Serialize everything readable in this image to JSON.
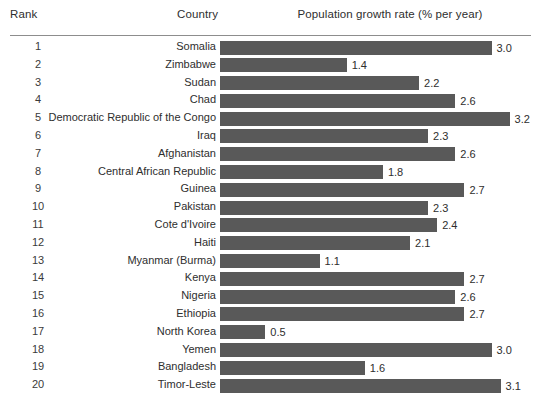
{
  "header": {
    "rank_label": "Rank",
    "country_label": "Country",
    "value_label": "Population growth rate (% per year)"
  },
  "style": {
    "bar_color": "#595959",
    "rule_color": "#8d8d8d",
    "text_color": "#2e2e2e",
    "background": "#ffffff"
  },
  "chart_data": {
    "type": "bar",
    "orientation": "horizontal",
    "title": "Population growth rate (% per year)",
    "xlabel": "Population growth rate (% per year)",
    "ylabel": "Country",
    "xlim": [
      0,
      3.4
    ],
    "grid": false,
    "legend": null,
    "value_labels": true,
    "categories": [
      "Somalia",
      "Zimbabwe",
      "Sudan",
      "Chad",
      "Democratic Republic of the Congo",
      "Iraq",
      "Afghanistan",
      "Central African Republic",
      "Guinea",
      "Pakistan",
      "Cote d'Ivoire",
      "Haiti",
      "Myanmar (Burma)",
      "Kenya",
      "Nigeria",
      "Ethiopia",
      "North Korea",
      "Yemen",
      "Bangladesh",
      "Timor-Leste"
    ],
    "values": [
      3.0,
      1.4,
      2.2,
      2.6,
      3.2,
      2.3,
      2.6,
      1.8,
      2.7,
      2.3,
      2.4,
      2.1,
      1.1,
      2.7,
      2.6,
      2.7,
      0.5,
      3.0,
      1.6,
      3.1
    ],
    "ranks": [
      1,
      2,
      3,
      4,
      5,
      6,
      7,
      8,
      9,
      10,
      11,
      12,
      13,
      14,
      15,
      16,
      17,
      18,
      19,
      20
    ]
  },
  "rows": [
    {
      "rank": "1",
      "country": "Somalia",
      "value": 3.0,
      "value_label": "3.0"
    },
    {
      "rank": "2",
      "country": "Zimbabwe",
      "value": 1.4,
      "value_label": "1.4"
    },
    {
      "rank": "3",
      "country": "Sudan",
      "value": 2.2,
      "value_label": "2.2"
    },
    {
      "rank": "4",
      "country": "Chad",
      "value": 2.6,
      "value_label": "2.6"
    },
    {
      "rank": "5",
      "country": "Democratic Republic of the Congo",
      "value": 3.2,
      "value_label": "3.2"
    },
    {
      "rank": "6",
      "country": "Iraq",
      "value": 2.3,
      "value_label": "2.3"
    },
    {
      "rank": "7",
      "country": "Afghanistan",
      "value": 2.6,
      "value_label": "2.6"
    },
    {
      "rank": "8",
      "country": "Central African Republic",
      "value": 1.8,
      "value_label": "1.8"
    },
    {
      "rank": "9",
      "country": "Guinea",
      "value": 2.7,
      "value_label": "2.7"
    },
    {
      "rank": "10",
      "country": "Pakistan",
      "value": 2.3,
      "value_label": "2.3"
    },
    {
      "rank": "11",
      "country": "Cote d'Ivoire",
      "value": 2.4,
      "value_label": "2.4"
    },
    {
      "rank": "12",
      "country": "Haiti",
      "value": 2.1,
      "value_label": "2.1"
    },
    {
      "rank": "13",
      "country": "Myanmar (Burma)",
      "value": 1.1,
      "value_label": "1.1"
    },
    {
      "rank": "14",
      "country": "Kenya",
      "value": 2.7,
      "value_label": "2.7"
    },
    {
      "rank": "15",
      "country": "Nigeria",
      "value": 2.6,
      "value_label": "2.6"
    },
    {
      "rank": "16",
      "country": "Ethiopia",
      "value": 2.7,
      "value_label": "2.7"
    },
    {
      "rank": "17",
      "country": "North Korea",
      "value": 0.5,
      "value_label": "0.5"
    },
    {
      "rank": "18",
      "country": "Yemen",
      "value": 3.0,
      "value_label": "3.0"
    },
    {
      "rank": "19",
      "country": "Bangladesh",
      "value": 1.6,
      "value_label": "1.6"
    },
    {
      "rank": "20",
      "country": "Timor-Leste",
      "value": 3.1,
      "value_label": "3.1"
    }
  ],
  "scale": {
    "px_per_unit": 90.5
  }
}
